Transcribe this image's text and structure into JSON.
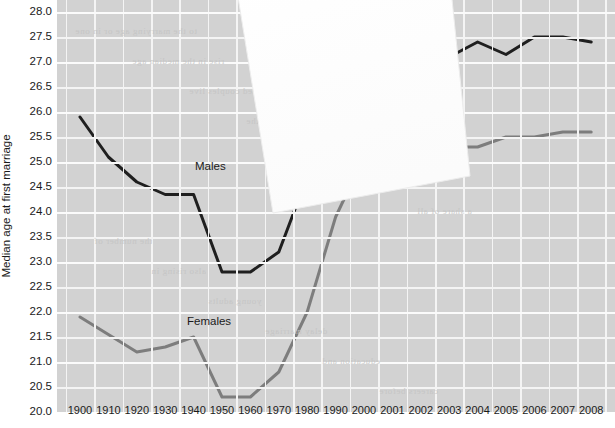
{
  "chart_data": {
    "type": "line",
    "title": "",
    "xlabel": "",
    "ylabel": "Median age at first marriage",
    "ylim": [
      20.0,
      28.0
    ],
    "ytick_labels": [
      "28.0",
      "27.5",
      "27.0",
      "26.5",
      "26.0",
      "25.5",
      "25.0",
      "24.5",
      "24.0",
      "23.5",
      "23.0",
      "22.5",
      "22.0",
      "21.5",
      "21.0",
      "20.5",
      "20.0"
    ],
    "ytick_values": [
      28.0,
      27.5,
      27.0,
      26.5,
      26.0,
      25.5,
      25.0,
      24.5,
      24.0,
      23.5,
      23.0,
      22.5,
      22.0,
      21.5,
      21.0,
      20.5,
      20.0
    ],
    "grid": true,
    "legend": "inline-annotation",
    "categories": [
      "1900",
      "1910",
      "1920",
      "1930",
      "1940",
      "1950",
      "1960",
      "1970",
      "1980",
      "1990",
      "2000",
      "2001",
      "2002",
      "2003",
      "2004",
      "2005",
      "2006",
      "2007",
      "2008"
    ],
    "series": [
      {
        "name": "Males",
        "color": "#1f1f1f",
        "values": [
          25.9,
          25.1,
          24.6,
          24.35,
          24.35,
          22.8,
          22.8,
          23.2,
          24.7,
          26.1,
          26.8,
          26.9,
          26.9,
          27.1,
          27.4,
          27.15,
          27.5,
          27.5,
          27.4
        ]
      },
      {
        "name": "Females",
        "color": "#7d7d7d",
        "values": [
          21.9,
          21.55,
          21.2,
          21.3,
          21.5,
          20.3,
          20.3,
          20.8,
          22.0,
          23.9,
          25.1,
          25.1,
          25.3,
          25.3,
          25.3,
          25.5,
          25.5,
          25.6,
          25.6
        ]
      }
    ],
    "occlusion": {
      "note": "A white sheet of paper overlaps the chart, hiding data roughly between 1970 and 2003.",
      "shape": "rotated-rectangle",
      "color": "#ffffff"
    }
  },
  "ghost_text": [
    "to the marrying age or in one",
    "rise in the median age",
    "married couples live",
    "percent of all the",
    "in the decade",
    "households with",
    "a share of all",
    "the number of",
    "also rising in",
    "young adults",
    "delay marriage",
    "education and",
    "careers before"
  ]
}
